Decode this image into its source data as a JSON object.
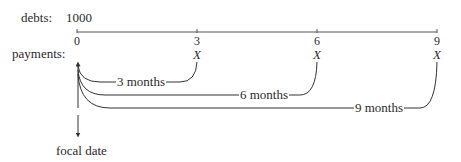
{
  "debts": {
    "label": "debts:",
    "amount": "1000"
  },
  "payments": {
    "label": "payments:",
    "payment_symbol": "X"
  },
  "timeline": {
    "ticks": [
      {
        "label": "0",
        "month": 0
      },
      {
        "label": "3",
        "month": 3
      },
      {
        "label": "6",
        "month": 6
      },
      {
        "label": "9",
        "month": 9
      }
    ]
  },
  "payment_marks": [
    {
      "label": "X",
      "month": 3
    },
    {
      "label": "X",
      "month": 6
    },
    {
      "label": "X",
      "month": 9
    }
  ],
  "intervals": [
    {
      "label": "3 months",
      "from": 0,
      "to": 3
    },
    {
      "label": "6 months",
      "from": 0,
      "to": 6
    },
    {
      "label": "9 months",
      "from": 0,
      "to": 9
    }
  ],
  "focal_date": {
    "label": "focal date",
    "month": 0
  }
}
